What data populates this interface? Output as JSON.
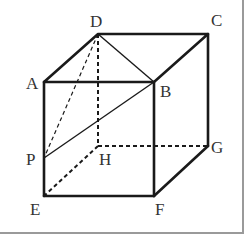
{
  "figure": {
    "type": "cube",
    "line_color": "#1a1a1a",
    "label_color": "#333333",
    "frame_color": "#999999",
    "vertices": {
      "A": {
        "label": "A",
        "x": 44,
        "y": 82
      },
      "B": {
        "label": "B",
        "x": 154,
        "y": 82
      },
      "C": {
        "label": "C",
        "x": 208,
        "y": 34
      },
      "D": {
        "label": "D",
        "x": 98,
        "y": 34
      },
      "E": {
        "label": "E",
        "x": 44,
        "y": 196
      },
      "F": {
        "label": "F",
        "x": 154,
        "y": 196
      },
      "G": {
        "label": "G",
        "x": 208,
        "y": 146
      },
      "H": {
        "label": "H",
        "x": 98,
        "y": 146
      },
      "P": {
        "label": "P",
        "x": 44,
        "y": 158
      }
    },
    "edges_solid": [
      "AB",
      "BC",
      "CD",
      "DA",
      "AE",
      "BF",
      "CG",
      "EF",
      "FG"
    ],
    "edges_hidden": [
      "DH",
      "HE",
      "HG"
    ],
    "segments_solid_thin": [
      "DB",
      "PB"
    ],
    "segments_dashed_thin": [
      "DP"
    ]
  }
}
